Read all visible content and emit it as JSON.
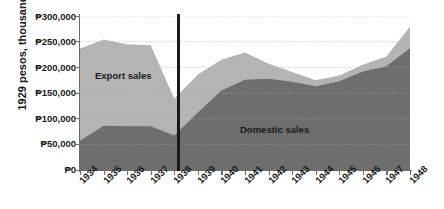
{
  "chart": {
    "ylabel": "1929 pesos, thousands",
    "ytick_labels": [
      "₱300,000",
      "₱250,000",
      "₱200,000",
      "₱150,000",
      "₱100,000",
      "₱50,000",
      "₱0"
    ],
    "series_labels": {
      "export": "Export sales",
      "domestic": "Domestic sales"
    },
    "colors": {
      "export_area": "#b4b4b4",
      "domestic_area": "#6e6e6e",
      "axis": "#6d6d6d",
      "gridline": "#c9c9c9",
      "divider": "#1a1a1a",
      "text": "#1a1a1a",
      "background": "#ffffff"
    }
  },
  "chart_data": {
    "type": "area",
    "stacked": true,
    "title": "",
    "xlabel": "",
    "ylabel": "1929 pesos, thousands",
    "ylim": [
      0,
      300000
    ],
    "ytick_values": [
      0,
      50000,
      100000,
      150000,
      200000,
      250000,
      300000
    ],
    "grid": true,
    "legend_position": "inline-annotations",
    "x": [
      1934,
      1935,
      1936,
      1937,
      1938,
      1939,
      1940,
      1941,
      1942,
      1943,
      1944,
      1945,
      1946,
      1947,
      1948
    ],
    "categories": [
      "1934",
      "1935",
      "1936",
      "1937",
      "1938",
      "1939",
      "1940",
      "1941",
      "1942",
      "1943",
      "1944",
      "1945",
      "1946",
      "1947",
      "1948"
    ],
    "series": [
      {
        "name": "Domestic sales",
        "values": [
          57000,
          86000,
          85000,
          85000,
          67000,
          112000,
          155000,
          176000,
          178000,
          172000,
          163000,
          173000,
          192000,
          202000,
          237000
        ]
      },
      {
        "name": "Export sales",
        "values": [
          179000,
          168000,
          160000,
          158000,
          72000,
          74000,
          60000,
          53000,
          29000,
          19000,
          12000,
          11000,
          13000,
          19000,
          42000
        ]
      }
    ],
    "totals": [
      236000,
      254000,
      245000,
      243000,
      139000,
      186000,
      215000,
      229000,
      207000,
      191000,
      175000,
      184000,
      205000,
      221000,
      279000
    ],
    "annotations": [
      {
        "type": "vertical-line",
        "x": 1938,
        "style": "thick-black"
      },
      {
        "type": "text",
        "label": "Export sales",
        "x": 1935.3,
        "y": 180000
      },
      {
        "type": "text",
        "label": "Domestic sales",
        "x": 1942.2,
        "y": 92000
      }
    ]
  }
}
